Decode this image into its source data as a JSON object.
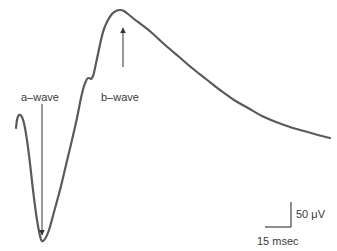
{
  "figure": {
    "labels": {
      "a_wave": "a–wave",
      "b_wave": "b–wave"
    },
    "scale_bar": {
      "amplitude": "50 μV",
      "time": "15 msec"
    },
    "colors": {
      "trace": "#5a5a5a",
      "arrow": "#555555",
      "text": "#3a3a3a",
      "background": "#ffffff"
    },
    "trace_points": [
      [
        16,
        128
      ],
      [
        17,
        120
      ],
      [
        19,
        115
      ],
      [
        22,
        117
      ],
      [
        25,
        128
      ],
      [
        29,
        155
      ],
      [
        33,
        190
      ],
      [
        37,
        220
      ],
      [
        40,
        236
      ],
      [
        42,
        241
      ],
      [
        45,
        239
      ],
      [
        49,
        230
      ],
      [
        54,
        212
      ],
      [
        60,
        190
      ],
      [
        66,
        165
      ],
      [
        72,
        140
      ],
      [
        77,
        118
      ],
      [
        81,
        98
      ],
      [
        84,
        86
      ],
      [
        87,
        79
      ],
      [
        89,
        78
      ],
      [
        91,
        79
      ],
      [
        93,
        76
      ],
      [
        95,
        68
      ],
      [
        98,
        54
      ],
      [
        101,
        40
      ],
      [
        104,
        29
      ],
      [
        108,
        20
      ],
      [
        112,
        14
      ],
      [
        116,
        11
      ],
      [
        120,
        10
      ],
      [
        124,
        11
      ],
      [
        128,
        14
      ],
      [
        134,
        19
      ],
      [
        142,
        25
      ],
      [
        152,
        33
      ],
      [
        164,
        44
      ],
      [
        178,
        56
      ],
      [
        192,
        68
      ],
      [
        206,
        79
      ],
      [
        220,
        90
      ],
      [
        234,
        100
      ],
      [
        248,
        108
      ],
      [
        262,
        116
      ],
      [
        276,
        122
      ],
      [
        290,
        127
      ],
      [
        304,
        131
      ],
      [
        318,
        135
      ],
      [
        330,
        138
      ]
    ],
    "a_wave_arrow": {
      "x": 42,
      "y1": 104,
      "y2": 235
    },
    "b_wave_arrow": {
      "x": 123,
      "y1": 67,
      "y2": 28
    }
  }
}
